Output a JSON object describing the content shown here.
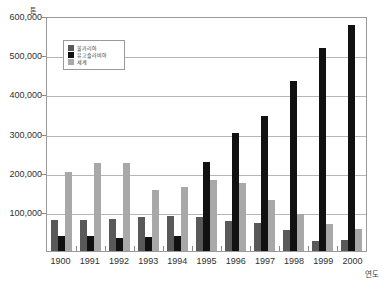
{
  "chart_data": {
    "type": "bar",
    "title": "",
    "xlabel": "연도",
    "ylabel": "톤",
    "ylim": [
      0,
      600000
    ],
    "ytick_labels": [
      "600,000",
      "500,000",
      "400,000",
      "300,000",
      "200,000",
      "100,000"
    ],
    "ytick_values": [
      600000,
      500000,
      400000,
      300000,
      200000,
      100000
    ],
    "grid": true,
    "legend_position": "upper-left-inside",
    "categories": [
      "1900",
      "1991",
      "1992",
      "1993",
      "1994",
      "1995",
      "1996",
      "1997",
      "1998",
      "1999",
      "2000"
    ],
    "series": [
      {
        "name": "불가리아",
        "color": "#595959",
        "values": [
          78000,
          78000,
          83000,
          86000,
          90000,
          86000,
          76000,
          71000,
          53000,
          25000,
          27000
        ]
      },
      {
        "name": "유고슬라비아",
        "color": "#111111",
        "values": [
          38000,
          38000,
          34000,
          37000,
          38000,
          228000,
          301000,
          344000,
          435000,
          518000,
          578000
        ]
      },
      {
        "name": "세계",
        "color": "#a8a8a8",
        "values": [
          201000,
          224000,
          224000,
          156000,
          164000,
          182000,
          174000,
          129000,
          94000,
          69000,
          55000
        ]
      }
    ]
  }
}
